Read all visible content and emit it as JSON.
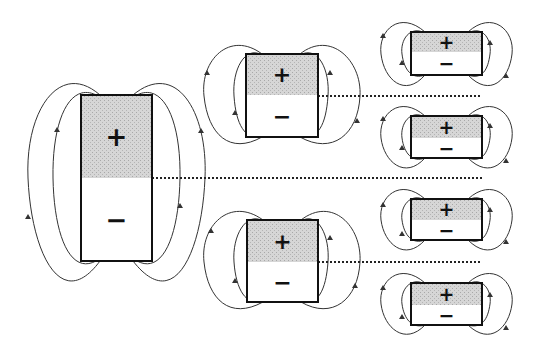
{
  "diagram": {
    "colors": {
      "outline": "#111111",
      "shade": "#cfcfcf",
      "field_line": "#333333",
      "dotted": "#222222",
      "background": "#ffffff"
    },
    "symbols": {
      "positive": "+",
      "negative": "−"
    },
    "dipoles": [
      {
        "id": "large",
        "x": 81,
        "y": 95,
        "w": 71,
        "h": 166,
        "split": 83,
        "plus_size": 26,
        "minus_size": 26
      },
      {
        "id": "medium-top",
        "x": 246,
        "y": 54,
        "w": 72,
        "h": 83,
        "split": 41,
        "plus_size": 22,
        "minus_size": 22
      },
      {
        "id": "medium-bottom",
        "x": 247,
        "y": 220,
        "w": 71,
        "h": 82,
        "split": 42,
        "plus_size": 22,
        "minus_size": 22
      },
      {
        "id": "small-1",
        "x": 411,
        "y": 32,
        "w": 71,
        "h": 43,
        "split": 20,
        "plus_size": 19,
        "minus_size": 19
      },
      {
        "id": "small-2",
        "x": 411,
        "y": 116,
        "w": 71,
        "h": 42,
        "split": 22,
        "plus_size": 19,
        "minus_size": 19
      },
      {
        "id": "small-3",
        "x": 411,
        "y": 199,
        "w": 71,
        "h": 41,
        "split": 21,
        "plus_size": 19,
        "minus_size": 19
      },
      {
        "id": "small-4",
        "x": 411,
        "y": 283,
        "w": 71,
        "h": 42,
        "split": 22,
        "plus_size": 19,
        "minus_size": 19
      }
    ],
    "dotted_lines": [
      {
        "x1": 152,
        "x2": 482,
        "y": 178
      },
      {
        "x1": 318,
        "x2": 482,
        "y": 96
      },
      {
        "x1": 318,
        "x2": 482,
        "y": 262
      }
    ]
  }
}
